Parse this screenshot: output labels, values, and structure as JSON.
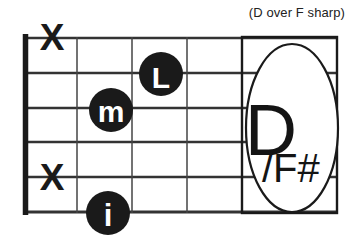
{
  "diagram": {
    "caption": "(D over F sharp)",
    "chord_name": "D",
    "chord_bass": "/F#",
    "strings_count": 6,
    "frets_count": 5,
    "colors": {
      "ink": "#1a1a1a",
      "line": "#333333",
      "background": "#ffffff",
      "marker_fill": "#1a1a1a",
      "marker_text": "#ffffff"
    },
    "muted_strings": [
      {
        "label": "X",
        "string": 1
      },
      {
        "label": "X",
        "string": 5
      }
    ],
    "finger_markers": [
      {
        "label": "L",
        "string": 2,
        "fret": 3
      },
      {
        "label": "m",
        "string": 3,
        "fret": 2
      },
      {
        "label": "i",
        "string": 6,
        "fret": 2
      }
    ]
  }
}
